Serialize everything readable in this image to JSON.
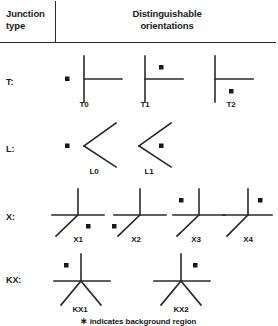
{
  "header": {
    "left_label": "Junction\ntype",
    "left_line1": "Junction",
    "left_line2": "type",
    "right_line1": "Distinguishable",
    "right_line2": "orientations"
  },
  "footnote": {
    "marker": "∗",
    "text": "indicates background region"
  },
  "style": {
    "stroke_color": "#2a2a2a",
    "text_color": "#1a1a1a",
    "background": "#ffffff"
  },
  "rows": [
    {
      "id": "t",
      "label": "T:",
      "items": [
        {
          "id": "t0",
          "label": "T0",
          "star_position": "left"
        },
        {
          "id": "t1",
          "label": "T1",
          "star_position": "upper-right"
        },
        {
          "id": "t2",
          "label": "T2",
          "star_position": "lower-right"
        }
      ]
    },
    {
      "id": "l",
      "label": "L:",
      "items": [
        {
          "id": "l0",
          "label": "L0",
          "star_position": "left"
        },
        {
          "id": "l1",
          "label": "L1",
          "star_position": "right"
        }
      ]
    },
    {
      "id": "x",
      "label": "X:",
      "items": [
        {
          "id": "x1",
          "label": "X1",
          "star_position": "lower-right"
        },
        {
          "id": "x2",
          "label": "X2",
          "star_position": "lower-left"
        },
        {
          "id": "x3",
          "label": "X3",
          "star_position": "upper-left"
        },
        {
          "id": "x4",
          "label": "X4",
          "star_position": "upper-right"
        }
      ]
    },
    {
      "id": "kx",
      "label": "KX:",
      "items": [
        {
          "id": "kx1",
          "label": "KX1",
          "star_position": "upper-left"
        },
        {
          "id": "kx2",
          "label": "KX2",
          "star_position": "upper-right"
        }
      ]
    }
  ]
}
